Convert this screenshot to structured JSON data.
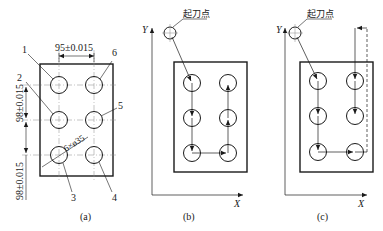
{
  "panels": {
    "a": {
      "caption": "(a)",
      "dim_horizontal": "95±0.015",
      "dim_vertical_1": "98±0.015",
      "dim_vertical_2": "98±0.015",
      "hole_spec": "6×ø35",
      "hole_labels": [
        "1",
        "2",
        "3",
        "4",
        "5",
        "6"
      ]
    },
    "b": {
      "caption": "(b)",
      "start_point_label": "起刀点",
      "axis_x": "X",
      "axis_y": "Y",
      "path_order": [
        "1",
        "2",
        "3",
        "4",
        "5",
        "6"
      ]
    },
    "c": {
      "caption": "(c)",
      "start_point_label": "起刀点",
      "axis_x": "X",
      "axis_y": "Y",
      "path_order": [
        "1",
        "2",
        "3",
        "4",
        "overtravel",
        "6",
        "5"
      ]
    }
  },
  "colors": {
    "line": "#1a1a1a",
    "centerline": "#777777"
  }
}
